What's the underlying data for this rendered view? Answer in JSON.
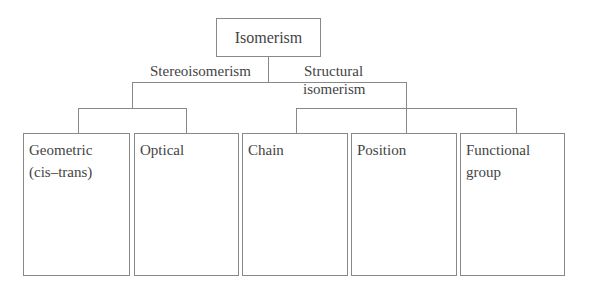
{
  "diagram": {
    "type": "hierarchy-tree",
    "root": {
      "label": "Isomerism"
    },
    "branches": [
      {
        "label": "Stereoisomerism",
        "children": [
          {
            "label_lines": [
              "Geometric",
              "(cis–trans)"
            ]
          },
          {
            "label_lines": [
              "Optical"
            ]
          }
        ]
      },
      {
        "label_lines": [
          "Structural",
          "isomerism"
        ],
        "children": [
          {
            "label_lines": [
              "Chain"
            ]
          },
          {
            "label_lines": [
              "Position"
            ]
          },
          {
            "label_lines": [
              "Functional",
              "group"
            ]
          }
        ]
      }
    ]
  }
}
